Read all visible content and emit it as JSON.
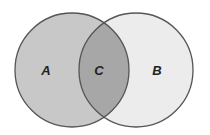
{
  "diagram": {
    "type": "venn",
    "sets": [
      {
        "id": "A",
        "label": "A",
        "region": "left-only",
        "fill": "#c8c8c8"
      },
      {
        "id": "B",
        "label": "B",
        "region": "right-only",
        "fill": "#ececec"
      }
    ],
    "intersection": {
      "id": "C",
      "label": "C",
      "fill": "#a7a7a7"
    },
    "outline_color": "#555555",
    "label_color": "#222222"
  }
}
